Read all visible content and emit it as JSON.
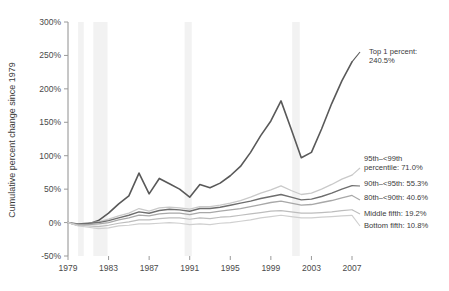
{
  "chart_data": {
    "type": "line",
    "title": "",
    "xlabel": "",
    "ylabel": "Cumulative percent change since 1979",
    "xlim": [
      1979,
      2007
    ],
    "ylim": [
      -50,
      300
    ],
    "ytick_labels": [
      "300%",
      "250%",
      "200%",
      "150%",
      "100%",
      "50%",
      "0%",
      "-50%"
    ],
    "ytick_values": [
      300,
      250,
      200,
      150,
      100,
      50,
      0,
      -50
    ],
    "xtick_labels": [
      "1979",
      "1983",
      "1987",
      "1991",
      "1995",
      "1999",
      "2003",
      "2007"
    ],
    "xtick_values": [
      1979,
      1983,
      1987,
      1991,
      1995,
      1999,
      2003,
      2007
    ],
    "grid": false,
    "legend_position": "right-inline-annotations",
    "x": [
      1979,
      1980,
      1981,
      1982,
      1983,
      1984,
      1985,
      1986,
      1987,
      1988,
      1989,
      1990,
      1991,
      1992,
      1993,
      1994,
      1995,
      1996,
      1997,
      1998,
      1999,
      2000,
      2001,
      2002,
      2003,
      2004,
      2005,
      2006,
      2007
    ],
    "series": [
      {
        "name": "Top 1 percent",
        "label": "Top 1 percent: 240.5%",
        "end_value": 240.5,
        "color": "#595959",
        "width": 1.6,
        "values": [
          0,
          -4,
          -2,
          3,
          14,
          28,
          40,
          74,
          43,
          66,
          58,
          50,
          38,
          57,
          52,
          59,
          70,
          84,
          105,
          130,
          152,
          182,
          140,
          97,
          105,
          140,
          178,
          212,
          240.5
        ]
      },
      {
        "name": "95th-<99th percentile",
        "label": "95th–<99th percentile: 71.0%",
        "end_value": 71.0,
        "color": "#c9c9c9",
        "width": 1.3,
        "values": [
          0,
          -2,
          -1,
          1,
          5,
          10,
          14,
          21,
          17,
          22,
          23,
          22,
          20,
          24,
          24,
          26,
          29,
          33,
          38,
          44,
          49,
          55,
          48,
          42,
          44,
          50,
          57,
          65,
          71.0
        ]
      },
      {
        "name": "90th-<95th",
        "label": "90th–<95th: 55.3%",
        "end_value": 55.3,
        "color": "#6e6e6e",
        "width": 1.4,
        "values": [
          0,
          -2,
          -1,
          0,
          3,
          7,
          11,
          16,
          14,
          18,
          20,
          19,
          17,
          21,
          21,
          23,
          26,
          29,
          32,
          36,
          39,
          42,
          38,
          34,
          35,
          39,
          44,
          50,
          55.3
        ]
      },
      {
        "name": "80th-<90th",
        "label": "80th–<90th: 40.6%",
        "end_value": 40.6,
        "color": "#a8a8a8",
        "width": 1.3,
        "values": [
          0,
          -3,
          -3,
          -2,
          0,
          4,
          7,
          11,
          10,
          13,
          14,
          14,
          12,
          15,
          15,
          17,
          19,
          21,
          24,
          27,
          30,
          32,
          29,
          26,
          27,
          30,
          33,
          37,
          40.6
        ]
      },
      {
        "name": "Middle fifth",
        "label": "Middle fifth: 19.2%",
        "end_value": 19.2,
        "color": "#bdbdbd",
        "width": 1.2,
        "values": [
          0,
          -4,
          -5,
          -6,
          -4,
          -1,
          1,
          4,
          4,
          6,
          7,
          7,
          5,
          7,
          6,
          8,
          9,
          11,
          13,
          15,
          17,
          18,
          16,
          14,
          14,
          15,
          16,
          18,
          19.2
        ]
      },
      {
        "name": "Bottom fifth",
        "label": "Bottom fifth: 10.8%",
        "end_value": 10.8,
        "color": "#cfcfcf",
        "width": 1.2,
        "values": [
          0,
          -5,
          -7,
          -9,
          -8,
          -5,
          -4,
          -2,
          -2,
          -1,
          0,
          -1,
          -3,
          -2,
          -3,
          -1,
          0,
          2,
          4,
          7,
          9,
          11,
          9,
          7,
          7,
          8,
          9,
          10,
          10.8
        ]
      }
    ],
    "recession_bands": [
      {
        "start": 1980.0,
        "end": 1980.55
      },
      {
        "start": 1981.5,
        "end": 1982.9
      },
      {
        "start": 1990.5,
        "end": 1991.2
      },
      {
        "start": 2001.1,
        "end": 2001.85
      }
    ],
    "annotations": [
      {
        "name": "top-1-percent",
        "text_lines": [
          "Top 1 percent:",
          "240.5%"
        ],
        "x": 369,
        "y": 54
      },
      {
        "name": "p95-99",
        "text_lines": [
          "95th–<99th",
          "percentile: 71.0%"
        ],
        "x": 364,
        "y": 161
      },
      {
        "name": "p90-95",
        "text_lines": [
          "90th–<95th: 55.3%"
        ],
        "x": 364,
        "y": 186
      },
      {
        "name": "p80-90",
        "text_lines": [
          "80th–<90th: 40.6%"
        ],
        "x": 364,
        "y": 200
      },
      {
        "name": "middle-fifth",
        "text_lines": [
          "Middle fifth: 19.2%"
        ],
        "x": 364,
        "y": 216
      },
      {
        "name": "bottom-fifth",
        "text_lines": [
          "Bottom fifth: 10.8%"
        ],
        "x": 364,
        "y": 228
      }
    ]
  }
}
